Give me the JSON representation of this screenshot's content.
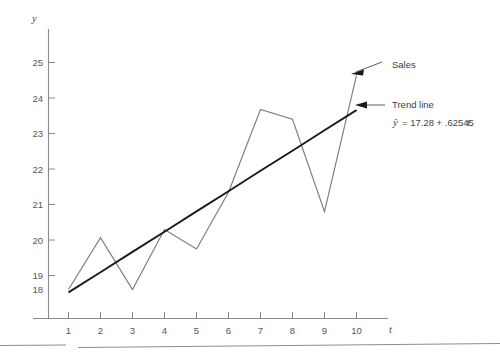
{
  "chart_data": {
    "type": "line",
    "title": "",
    "subtitle": "",
    "xlabel": "t",
    "ylabel": "y",
    "xlim": [
      0.4,
      11.4
    ],
    "ylim": [
      17.15,
      25.45
    ],
    "grid": false,
    "legend_position": "annotations-right",
    "x": [
      1,
      2,
      3,
      4,
      5,
      6,
      7,
      8,
      9,
      10
    ],
    "x_tick_labels": [
      "1",
      "2",
      "3",
      "4",
      "5",
      "6",
      "7",
      "8",
      "9",
      "10"
    ],
    "y_ticks": [
      18,
      19,
      20,
      21,
      22,
      23,
      24,
      25
    ],
    "y_tick_labels": [
      "18",
      "19",
      "20",
      "21",
      "22",
      "23",
      "24",
      "25"
    ],
    "series": [
      {
        "name": "Sales",
        "color": "#7d7d80",
        "values": [
          18.0,
          19.6,
          18.0,
          19.85,
          19.25,
          21.0,
          23.55,
          23.25,
          20.4,
          24.6
        ]
      },
      {
        "name": "Trend line",
        "color": "#1a1a1a",
        "values": [
          17.91,
          18.53,
          19.16,
          19.78,
          20.41,
          21.03,
          21.66,
          22.28,
          22.91,
          23.53
        ]
      }
    ],
    "annotations": [
      {
        "id": "sales",
        "label": "Sales",
        "equation": ""
      },
      {
        "id": "trend",
        "label": "Trend line",
        "equation_hat": "y",
        "equation_lhs": "ŷ =",
        "equation_body": "= 17.28 + .62545",
        "equation_intercept": "17.28",
        "equation_slope": ".62545",
        "equation_var": "t",
        "equation_full": "ŷ = 17.28 + .62545t"
      }
    ]
  },
  "axes": {
    "y_axis_label": "y",
    "x_axis_label": "t"
  },
  "annotations": {
    "sales_label": "Sales",
    "trend_label": "Trend line",
    "equation_prefix": "= 17.28 + .62545",
    "equation_var": "t",
    "equation_yhat": "ŷ"
  }
}
